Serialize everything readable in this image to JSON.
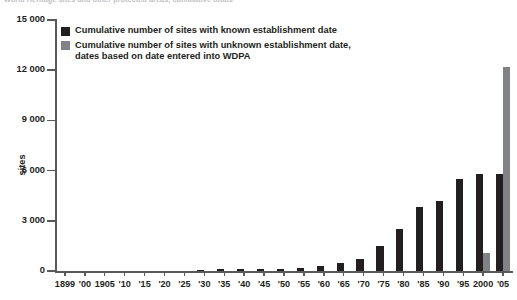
{
  "caption": {
    "cut_off_header": "World Heritage sites and other protected areas, cumulative totals"
  },
  "legend": {
    "position": "inside-top-left",
    "items": [
      {
        "key": "known",
        "color": "#231f20",
        "label": "Cumulative number of sites with known establishment date"
      },
      {
        "key": "unknown",
        "color": "#808285",
        "label": "Cumulative number of sites with unknown establishment date,\ndates based on date entered into WDPA"
      }
    ]
  },
  "axes": {
    "y_title": "sites",
    "y_ticks": [
      "0",
      "3 000",
      "6 000",
      "9 000",
      "12 000",
      "15 000"
    ],
    "y_tick_values": [
      0,
      3000,
      6000,
      9000,
      12000,
      15000
    ],
    "ylim": [
      0,
      15000
    ],
    "x_title": "",
    "grid": false
  },
  "chart_data": {
    "type": "bar",
    "title": "",
    "subtitle": "",
    "xlabel": "",
    "ylabel": "sites",
    "ylim": [
      0,
      15000
    ],
    "grid": false,
    "legend_position": "inside-top-left",
    "categories": [
      "1899",
      "'00",
      "1905",
      "'10",
      "'15",
      "'20",
      "'25",
      "'30",
      "'35",
      "'40",
      "'45",
      "'50",
      "'55",
      "'60",
      "'65",
      "'70",
      "'75",
      "'80",
      "'85",
      "'90",
      "'95",
      "2000",
      "'05"
    ],
    "series": [
      {
        "name": "Cumulative number of sites with known establishment date",
        "color": "#231f20",
        "values": [
          0,
          0,
          0,
          0,
          0,
          0,
          0,
          50,
          100,
          100,
          120,
          150,
          200,
          300,
          450,
          700,
          1500,
          2500,
          3800,
          4200,
          5500,
          5800,
          5800
        ]
      },
      {
        "name": "Cumulative number of sites with unknown establishment date, dates based on date entered into WDPA",
        "color": "#808285",
        "values": [
          0,
          0,
          0,
          0,
          0,
          0,
          0,
          0,
          0,
          0,
          0,
          0,
          0,
          0,
          0,
          0,
          0,
          0,
          0,
          0,
          0,
          1100,
          12200
        ]
      }
    ]
  }
}
